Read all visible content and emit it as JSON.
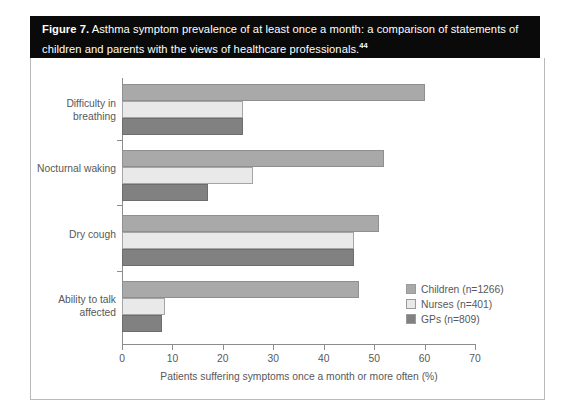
{
  "figure": {
    "label": "Figure 7.",
    "title_text": "Asthma symptom prevalence of at least once a month: a comparison of statements of children and parents with the views of healthcare professionals.",
    "reference_superscript": "44"
  },
  "colors": {
    "children": "#a9a9a9",
    "nurses": "#e9e9e9",
    "gps": "#818181",
    "axis": "#8c8c8c",
    "text": "#58585a",
    "title_bar_bg": "#0a0a0a",
    "title_bar_text": "#ffffff",
    "frame_border": "#b9b9b9"
  },
  "chart_data": {
    "type": "bar",
    "orientation": "horizontal",
    "title": "Asthma symptom prevalence of at least once a month: a comparison of statements of children and parents with the views of healthcare professionals.",
    "xlabel": "Patients suffering symptoms once a month or more often (%)",
    "ylabel": "",
    "xlim": [
      0,
      70
    ],
    "xticks": [
      0,
      10,
      20,
      30,
      40,
      50,
      60,
      70
    ],
    "xtick_labels": [
      "0",
      "10",
      "20",
      "30",
      "40",
      "50",
      "60",
      "70"
    ],
    "grid": false,
    "legend_position": "right-inside",
    "categories": [
      "Difficulty in breathing",
      "Nocturnal waking",
      "Dry cough",
      "Ability to talk affected"
    ],
    "series": [
      {
        "name": "Children (n=1266)",
        "color": "#a9a9a9",
        "values": [
          60,
          52,
          51,
          47
        ]
      },
      {
        "name": "Nurses (n=401)",
        "color": "#e9e9e9",
        "values": [
          24,
          26,
          46,
          8.5
        ]
      },
      {
        "name": "GPs (n=809)",
        "color": "#818181",
        "values": [
          24,
          17,
          46,
          8
        ]
      }
    ]
  },
  "legend": {
    "items": [
      {
        "label": "Children (n=1266)",
        "key": "children"
      },
      {
        "label": "Nurses (n=401)",
        "key": "nurses"
      },
      {
        "label": "GPs (n=809)",
        "key": "gps"
      }
    ]
  }
}
